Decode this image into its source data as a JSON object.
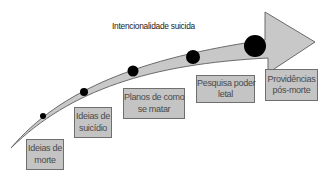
{
  "title": "Intencionalidade suicida",
  "stages": [
    {
      "line1": "Ideias de",
      "line2": "morte"
    },
    {
      "line1": "Ideias de",
      "line2": "suicídio"
    },
    {
      "line1": "Planos de como",
      "line2": "se matar"
    },
    {
      "line1": "Pesquisa poder",
      "line2": "letal"
    },
    {
      "line1": "Providências",
      "line2": "pós-morte"
    }
  ],
  "colors": {
    "arrow_fill": "#c8c8c8",
    "arrow_stroke": "#6a6a6a",
    "box_fill": "#c4c4c4",
    "dot": "#000000"
  }
}
